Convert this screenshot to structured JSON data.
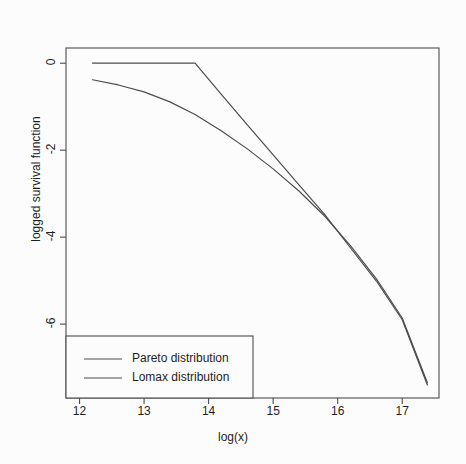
{
  "chart_data": {
    "type": "line",
    "title": "log-log plot",
    "xlabel": "log(x)",
    "ylabel": "logged survival function",
    "xlim": [
      11.79,
      17.57
    ],
    "ylim": [
      -7.7,
      0.35
    ],
    "xticks": [
      12,
      13,
      14,
      15,
      16,
      17
    ],
    "yticks": [
      0,
      -2,
      -4,
      -6
    ],
    "xtick_labels": [
      "12",
      "13",
      "14",
      "15",
      "16",
      "17"
    ],
    "ytick_labels": [
      "0",
      "-2",
      "-4",
      "-6"
    ],
    "grid": false,
    "legend_position": "bottom-left",
    "series": [
      {
        "name": "Pareto distribution",
        "color": "#4d4d4d",
        "x": [
          12.2,
          12.6,
          13.0,
          13.4,
          13.79,
          14.2,
          14.6,
          15.0,
          15.4,
          15.8,
          16.2,
          16.6,
          17.0,
          17.39
        ],
        "y": [
          0.0,
          0.0,
          0.0,
          0.0,
          0.0,
          -0.72,
          -1.42,
          -2.11,
          -2.8,
          -3.48,
          -4.25,
          -5.01,
          -5.9,
          -7.4
        ]
      },
      {
        "name": "Lomax distribution",
        "color": "#4d4d4d",
        "x": [
          12.2,
          12.6,
          13.0,
          13.4,
          13.79,
          14.2,
          14.6,
          15.0,
          15.4,
          15.8,
          16.2,
          16.6,
          17.0,
          17.39
        ],
        "y": [
          -0.38,
          -0.5,
          -0.66,
          -0.89,
          -1.18,
          -1.56,
          -1.97,
          -2.43,
          -2.94,
          -3.52,
          -4.2,
          -4.96,
          -5.86,
          -7.35
        ]
      }
    ]
  },
  "legend": {
    "entries": [
      {
        "label": "Pareto distribution"
      },
      {
        "label": "Lomax distribution"
      }
    ]
  },
  "colors": {
    "line": "#4d4d4d",
    "axis": "#4d4d4d",
    "text": "#1f1f1f",
    "background": "#fcfcfc"
  }
}
